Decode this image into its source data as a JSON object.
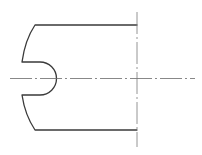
{
  "diagram": {
    "type": "engineering-drawing",
    "view": "partial-section",
    "colors": {
      "outline": "#3a3a3a",
      "centerline": "#6a6a6a",
      "background": "#ffffff"
    },
    "features": [
      {
        "name": "part-outline",
        "description": "Part outline with curved left edges and a U-shaped slot"
      },
      {
        "name": "u-slot",
        "description": "Semicircular-ended slot cut into the left edge"
      },
      {
        "name": "horizontal-centerline",
        "description": "Horizontal dash-dot axis line"
      },
      {
        "name": "vertical-centerline",
        "description": "Vertical dash-dot break / symmetry line"
      }
    ]
  }
}
